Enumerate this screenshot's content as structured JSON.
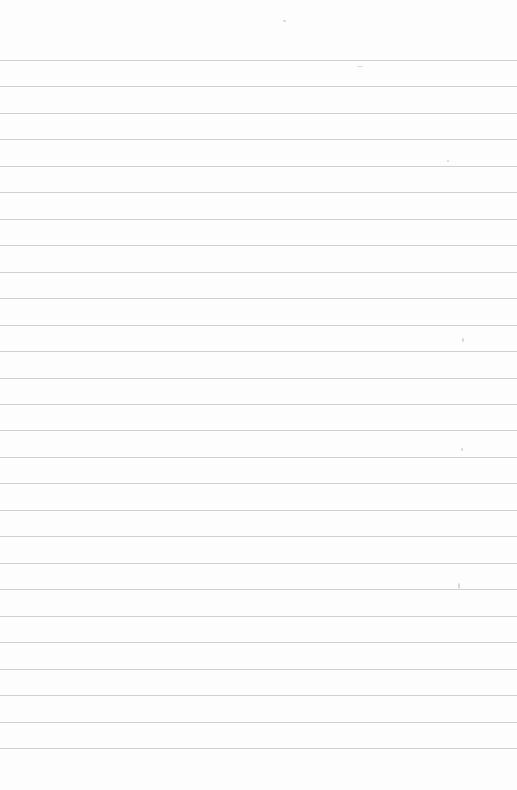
{
  "document": {
    "type": "ruled-paper",
    "content_text": "",
    "line_count": 27,
    "first_line_y": 60,
    "line_spacing_px": 26.46,
    "paper_color": "#fdfdfd",
    "line_color": "#c9c9c9"
  }
}
